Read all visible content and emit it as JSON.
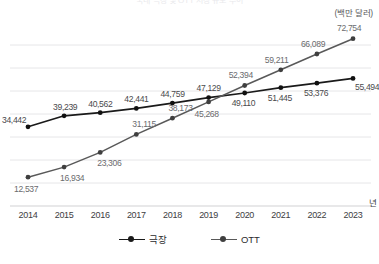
{
  "title": "국내 극장 및 OTT 시장 규모 추이",
  "unit_label": "(백만 달러)",
  "x_axis_name": "년",
  "legend": {
    "position": "bottom-center",
    "items": [
      {
        "label": "극장",
        "color": "#1a1a1a"
      },
      {
        "label": "OTT",
        "color": "#595959"
      }
    ]
  },
  "colors": {
    "theater_line": "#1a1a1a",
    "ott_line": "#595959",
    "grid": "#e6e6e8",
    "axis": "#d2d2d4",
    "label_text": "#6b6b6e",
    "tick_text": "#3d3d3f"
  },
  "chart_data": {
    "type": "line",
    "title": "국내 극장 및 OTT 시장 규모 추이",
    "xlabel": "년",
    "ylabel": "(백만 달러)",
    "categories": [
      "2014",
      "2015",
      "2016",
      "2017",
      "2018",
      "2019",
      "2020",
      "2021",
      "2022",
      "2023"
    ],
    "x": [
      2014,
      2015,
      2016,
      2017,
      2018,
      2019,
      2020,
      2021,
      2022,
      2023
    ],
    "ylim": [
      0,
      80000
    ],
    "grid": true,
    "gridlines": [
      10000,
      20000,
      30000,
      40000,
      50000,
      60000,
      70000
    ],
    "series": [
      {
        "name": "극장",
        "color": "#1a1a1a",
        "marker": "circle",
        "values": [
          34442,
          39239,
          40562,
          42441,
          44759,
          47129,
          49110,
          51445,
          53376,
          55494
        ],
        "labels": [
          "34,442",
          "39,239",
          "40,562",
          "42,441",
          "44,759",
          "47,129",
          "49,110",
          "51,445",
          "53,376",
          "55,494"
        ]
      },
      {
        "name": "OTT",
        "color": "#595959",
        "marker": "circle",
        "values": [
          12537,
          16934,
          23306,
          31115,
          38173,
          45268,
          52394,
          59211,
          66089,
          72754
        ],
        "labels": [
          "12,537",
          "16,934",
          "23,306",
          "31,115",
          "38,173",
          "45,268",
          "52,394",
          "59,211",
          "66,089",
          "72,754"
        ]
      }
    ]
  }
}
